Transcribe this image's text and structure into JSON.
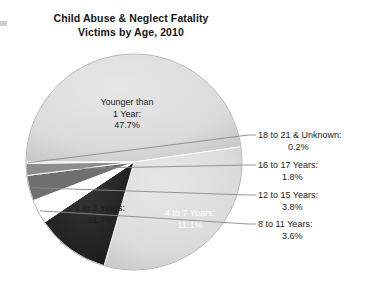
{
  "chart_data": {
    "type": "pie",
    "title": "Child Abuse & Neglect Fatality Victims by Age, 2010",
    "title_line1": "Child Abuse & Neglect Fatality",
    "title_line2": "Victims by Age, 2010",
    "xlabel": "",
    "ylabel": "",
    "legend": "none",
    "grid": false,
    "units": "percent",
    "categories": [
      "Younger than 1 Year",
      "1 to 3 Years",
      "4 to 7 Years",
      "8 to 11 Years",
      "12 to 15 Years",
      "16 to 17 Years",
      "18 to 21 & Unknown"
    ],
    "values": [
      47.7,
      31.7,
      11.1,
      3.6,
      3.8,
      1.8,
      0.2
    ],
    "slice_colors": [
      "#dcdcdc",
      "#dcdcdc",
      "#2a2a2a",
      "#ffffff",
      "#6f6f6f",
      "#8d8d8d",
      "#c8c8c8"
    ],
    "slices": [
      {
        "label": "Younger than 1 Year",
        "label_line1": "Younger than",
        "label_line2": "1 Year:",
        "value": 47.7,
        "pct_text": "47.7%",
        "color": "#dcdcdc",
        "label_placement": "inside"
      },
      {
        "label": "1 to 3 Years",
        "label_line1": "1 to 3 Years:",
        "value": 31.7,
        "pct_text": "31.7%",
        "color": "#dcdcdc",
        "label_placement": "inside"
      },
      {
        "label": "4 to 7 Years",
        "label_line1": "4 to 7 Years:",
        "value": 11.1,
        "pct_text": "11.1%",
        "color": "#2a2a2a",
        "label_placement": "inside"
      },
      {
        "label": "8 to 11 Years",
        "label_line1": "8 to 11 Years:",
        "value": 3.6,
        "pct_text": "3.6%",
        "color": "#ffffff",
        "label_placement": "callout"
      },
      {
        "label": "12 to 15 Years",
        "label_line1": "12 to 15 Years:",
        "value": 3.8,
        "pct_text": "3.8%",
        "color": "#6f6f6f",
        "label_placement": "callout"
      },
      {
        "label": "16 to 17 Years",
        "label_line1": "16 to 17 Years:",
        "value": 1.8,
        "pct_text": "1.8%",
        "color": "#8d8d8d",
        "label_placement": "callout"
      },
      {
        "label": "18 to 21 & Unknown",
        "label_line1": "18 to 21 & Unknown:",
        "value": 0.2,
        "pct_text": "0.2%",
        "color": "#c8c8c8",
        "label_placement": "callout"
      }
    ]
  },
  "colors": {
    "background": "#ffffff",
    "text": "#1d1d1d",
    "title": "#141414",
    "light_slice": "#dcdcdc",
    "dark_slice": "#2a2a2a",
    "mid_slice": "#6f6f6f",
    "leader_line": "#8a8a8a"
  }
}
